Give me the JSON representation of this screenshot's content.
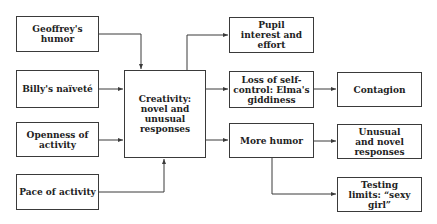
{
  "nodes": {
    "geoffrey": "Geoffrey's humor",
    "billy": "Billy's naïveté",
    "openness": "Openness of activity",
    "pace": "Pace of activity",
    "creativity": "Creativity: novel and unusual responses",
    "pupil": "Pupil interest and effort",
    "loss": "Loss of self-control: Elma's giddiness",
    "more_humor": "More humor",
    "contagion": "Contagion",
    "unusual": "Unusual and novel responses",
    "testing": "Testing limits: “sexy girl”"
  },
  "edges": [
    [
      "geoffrey",
      "creativity"
    ],
    [
      "billy",
      "creativity"
    ],
    [
      "openness",
      "creativity"
    ],
    [
      "pace",
      "creativity"
    ],
    [
      "creativity",
      "pupil"
    ],
    [
      "creativity",
      "loss"
    ],
    [
      "creativity",
      "more_humor"
    ],
    [
      "loss",
      "contagion"
    ],
    [
      "more_humor",
      "unusual"
    ],
    [
      "more_humor",
      "testing"
    ]
  ]
}
